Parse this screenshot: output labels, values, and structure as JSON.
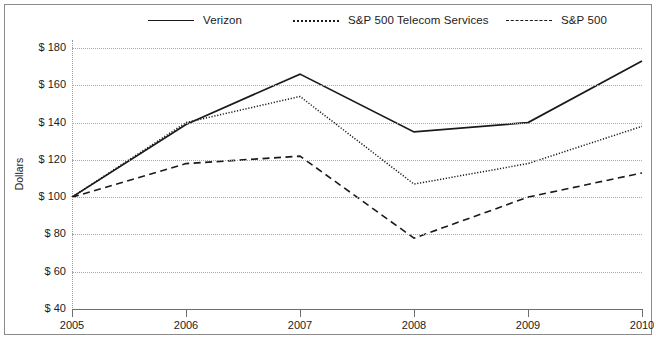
{
  "chart_data": {
    "type": "line",
    "title": "",
    "xlabel": "",
    "ylabel": "Dollars",
    "x": [
      2005,
      2006,
      2007,
      2008,
      2009,
      2010
    ],
    "xtick_labels": [
      "2005",
      "2006",
      "2007",
      "2008",
      "2009",
      "2010"
    ],
    "ytick_labels": [
      "$ 180",
      "$ 160",
      "$ 140",
      "$ 120",
      "$ 100",
      "$ 80",
      "$ 60",
      "$ 40"
    ],
    "ytick_values": [
      180,
      160,
      140,
      120,
      100,
      80,
      60,
      40
    ],
    "ylim": [
      40,
      180
    ],
    "xlim": [
      2005,
      2010
    ],
    "grid": "horizontal-dotted",
    "legend_position": "top",
    "series": [
      {
        "name": "Verizon",
        "style": "solid",
        "color": "#1a1a1a",
        "values": [
          100,
          139,
          166,
          135,
          140,
          173
        ]
      },
      {
        "name": "S&P 500 Telecom Services",
        "style": "dotted",
        "color": "#1a1a1a",
        "values": [
          100,
          140,
          154,
          107,
          118,
          138
        ]
      },
      {
        "name": "S&P 500",
        "style": "dashed",
        "color": "#1a1a1a",
        "values": [
          100,
          118,
          122,
          78,
          100,
          113
        ]
      }
    ]
  },
  "legend": {
    "items": [
      {
        "label": "Verizon",
        "swatch": "solid-line-swatch"
      },
      {
        "label": "S&P 500 Telecom Services",
        "swatch": "dotted-line-swatch"
      },
      {
        "label": "S&P 500",
        "swatch": "dashed-line-swatch"
      }
    ]
  },
  "axes": {
    "y_title": "Dollars"
  }
}
